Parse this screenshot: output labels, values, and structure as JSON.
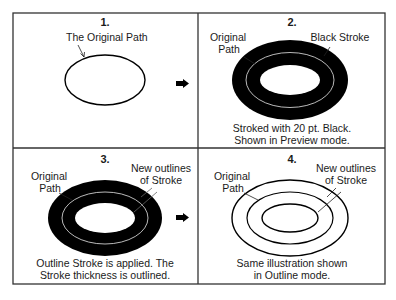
{
  "diagram": {
    "type": "four-panel illustration",
    "colors": {
      "stroke": "#000000",
      "background": "#ffffff",
      "border": "#333333",
      "path_highlight": "#e8e8e8"
    },
    "panels": [
      {
        "number": "1.",
        "labels": [
          "The Original Path"
        ],
        "caption": []
      },
      {
        "number": "2.",
        "labels": [
          "Original",
          "Path",
          "Black Stroke"
        ],
        "caption": [
          "Stroked with 20 pt. Black.",
          "Shown in Preview mode."
        ]
      },
      {
        "number": "3.",
        "labels": [
          "Original",
          "Path",
          "New outlines",
          "of Stroke"
        ],
        "caption": [
          "Outline Stroke is applied. The",
          "Stroke thickness is outlined."
        ]
      },
      {
        "number": "4.",
        "labels": [
          "Original",
          "Path",
          "New outlines",
          "of Stroke"
        ],
        "caption": [
          "Same illustration shown",
          "in Outline mode."
        ]
      }
    ],
    "arrows": [
      "arrow-right",
      "arrow-right"
    ]
  }
}
